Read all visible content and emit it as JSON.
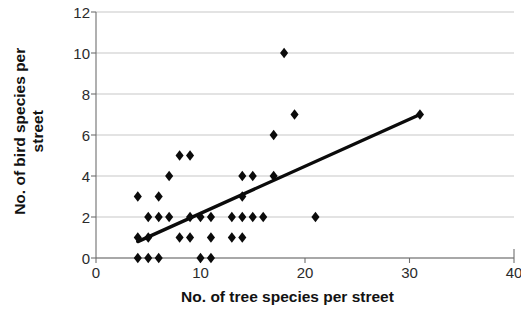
{
  "chart_data": {
    "type": "scatter",
    "title": "",
    "xlabel": "No. of tree species per street",
    "ylabel": "No. of bird species per street",
    "xlim": [
      0,
      40
    ],
    "ylim": [
      0,
      12
    ],
    "xticks": [
      0,
      10,
      20,
      30,
      40
    ],
    "yticks": [
      0,
      2,
      4,
      6,
      8,
      10,
      12
    ],
    "xtick_labels": [
      "0",
      "10",
      "20",
      "30",
      "40"
    ],
    "ytick_labels": [
      "0",
      "2",
      "4",
      "6",
      "8",
      "10",
      "12"
    ],
    "grid": "horizontal",
    "legend": "none",
    "marker": "diamond",
    "marker_color": "#0b0b0b",
    "points": [
      [
        4,
        0
      ],
      [
        5,
        0
      ],
      [
        6,
        0
      ],
      [
        10,
        0
      ],
      [
        11,
        0
      ],
      [
        4,
        1
      ],
      [
        5,
        1
      ],
      [
        8,
        1
      ],
      [
        9,
        1
      ],
      [
        11,
        1
      ],
      [
        13,
        1
      ],
      [
        14,
        1
      ],
      [
        5,
        2
      ],
      [
        6,
        2
      ],
      [
        7,
        2
      ],
      [
        9,
        2
      ],
      [
        10,
        2
      ],
      [
        11,
        2
      ],
      [
        13,
        2
      ],
      [
        14,
        2
      ],
      [
        15,
        2
      ],
      [
        16,
        2
      ],
      [
        21,
        2
      ],
      [
        4,
        3
      ],
      [
        6,
        3
      ],
      [
        14,
        3
      ],
      [
        7,
        4
      ],
      [
        14,
        4
      ],
      [
        15,
        4
      ],
      [
        17,
        4
      ],
      [
        8,
        5
      ],
      [
        9,
        5
      ],
      [
        17,
        6
      ],
      [
        19,
        7
      ],
      [
        31,
        7
      ],
      [
        18,
        10
      ]
    ],
    "trendline": {
      "visible": true,
      "color": "#0b0b0b",
      "x0": 4,
      "y0": 0.8,
      "x1": 31,
      "y1": 7.0
    }
  }
}
